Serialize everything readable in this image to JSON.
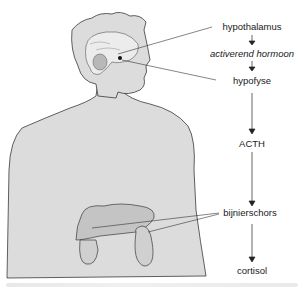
{
  "diagram": {
    "title": "",
    "flow": [
      {
        "id": "hypothalamus",
        "label": "hypothalamus",
        "style": "normal"
      },
      {
        "id": "activerend",
        "label": "activerend hormoon",
        "style": "italic"
      },
      {
        "id": "hypofyse",
        "label": "hypofyse",
        "style": "normal"
      },
      {
        "id": "acth",
        "label": "ACTH",
        "style": "normal"
      },
      {
        "id": "bijnierschors",
        "label": "bijnierschors",
        "style": "normal"
      },
      {
        "id": "cortisol",
        "label": "cortisol",
        "style": "normal"
      }
    ],
    "illustration": "human-torso-with-brain-liver-kidneys",
    "colors": {
      "body": "#dcdcdc",
      "outline": "#3a3a3a",
      "organ": "#c4c4c4",
      "brain": "#ececec",
      "text": "#1a1a1a"
    }
  }
}
